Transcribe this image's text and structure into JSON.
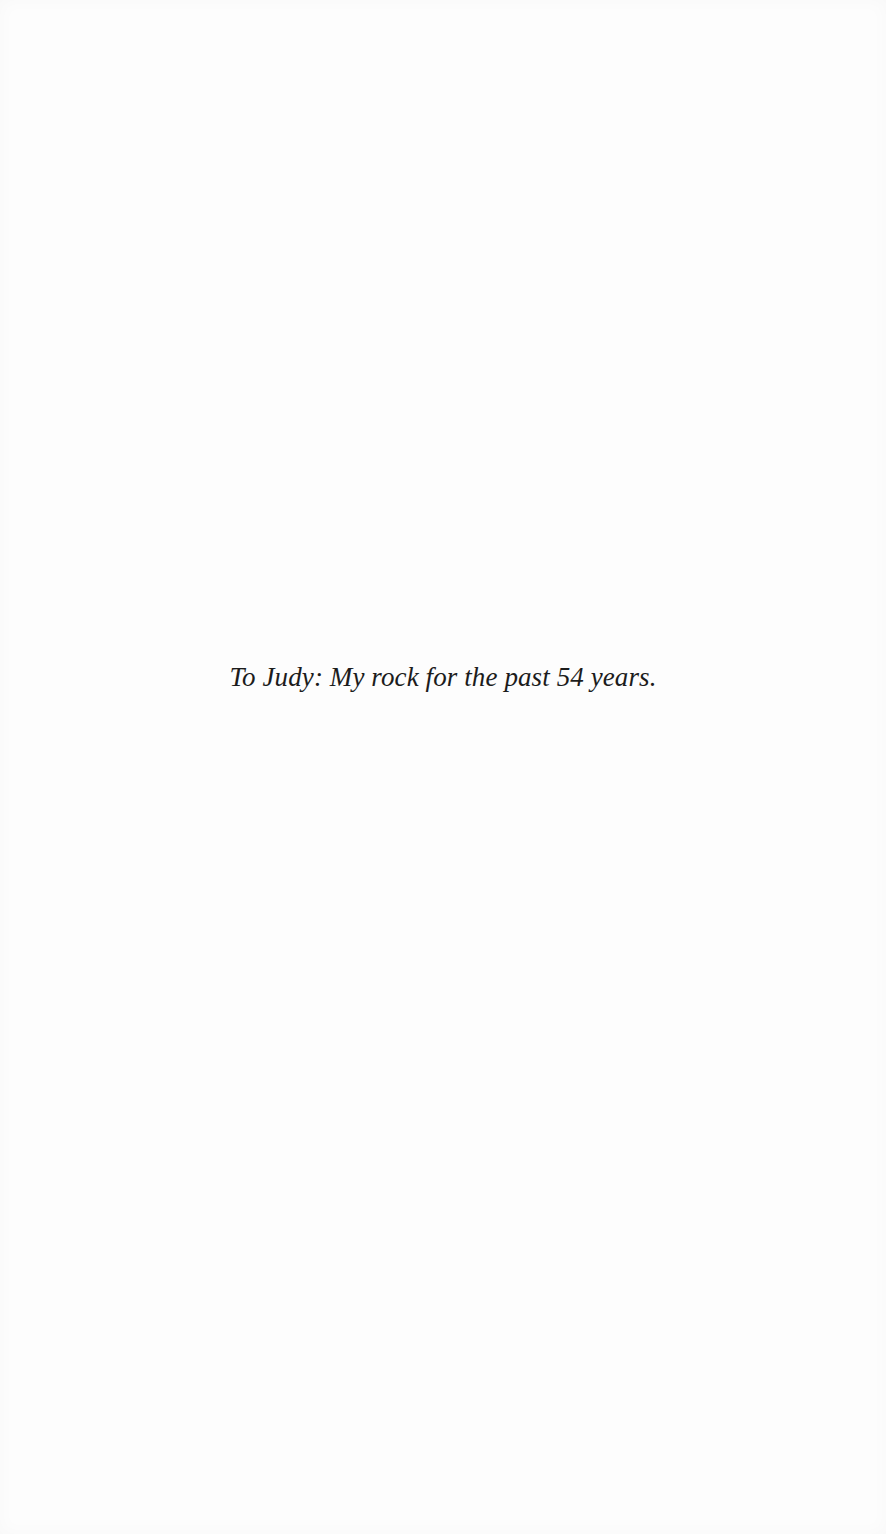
{
  "page": {
    "dedication": "To Judy: My rock for the past 54 years."
  },
  "colors": {
    "background": "#fdfdfd",
    "text": "#1c1c1c"
  }
}
